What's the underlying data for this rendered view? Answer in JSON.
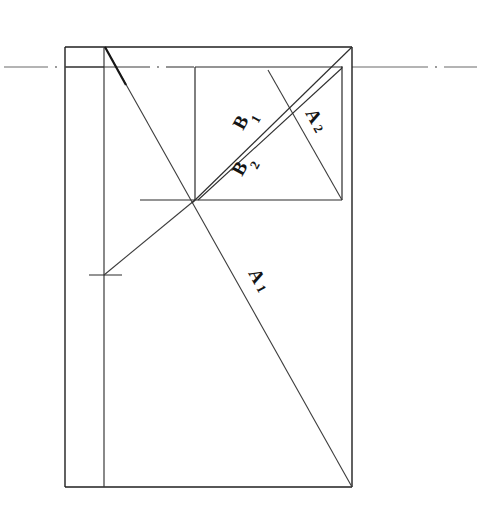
{
  "drawing": {
    "title": "Hand-drawn geometric construction diagram",
    "background_color": "#ffffff",
    "ink_color": "#1a1a1a",
    "line_color_light": "#4a4a4a",
    "canvas": {
      "width": 478,
      "height": 517
    },
    "labels": [
      {
        "id": "label-b1",
        "base": "B",
        "subscript": "1",
        "text": "B1",
        "x": 243,
        "y": 131,
        "rotation": -61
      },
      {
        "id": "label-b2",
        "base": "B",
        "subscript": "2",
        "text": "B2",
        "x": 255,
        "y": 163,
        "rotation": -61
      },
      {
        "id": "label-a2",
        "base": "A",
        "subscript": "2",
        "text": "A2",
        "x": 314,
        "y": 124,
        "rotation": 61
      },
      {
        "id": "label-a1",
        "base": "A",
        "subscript": "1",
        "text": "A1",
        "x": 256,
        "y": 286,
        "rotation": 61
      }
    ],
    "geometry": {
      "outer_rect": {
        "x1": 65,
        "y1": 47,
        "x2": 352,
        "y2": 487
      },
      "inner_rect": {
        "x1": 195,
        "y1": 67,
        "x2": 342,
        "y2": 200
      },
      "vertical_divider_x": 104,
      "centerline_y": 67,
      "crossing_point": {
        "x": 195,
        "y": 200
      },
      "tick_mark": {
        "x": 104,
        "y": 275,
        "x_start": 89,
        "x_end": 122
      },
      "bottom_extension": {
        "x_start": 140,
        "y": 200
      },
      "diagonal_a1": {
        "x1": 105,
        "y1": 47,
        "x2": 352,
        "y2": 487
      },
      "diagonal_a2": {
        "x1": 268,
        "y1": 70,
        "x2": 342,
        "y2": 200
      },
      "diagonal_b1": {
        "x1": 198,
        "y1": 199,
        "x2": 342,
        "y2": 67
      },
      "diagonal_b2": {
        "x1": 193,
        "y1": 203,
        "x2": 352,
        "y2": 47
      },
      "ray_lower_left": {
        "x1": 195,
        "y1": 200,
        "x2": 104,
        "y2": 275
      }
    },
    "centerline": {
      "style": "dash-dot",
      "y": 67,
      "left_span": {
        "x_start": 4,
        "x_end": 478
      }
    }
  }
}
